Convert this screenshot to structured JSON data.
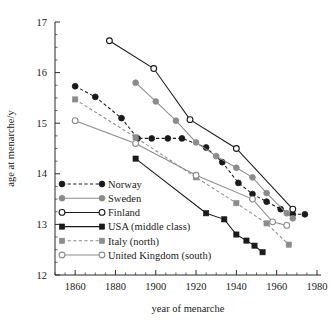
{
  "chart_data": {
    "type": "line",
    "title": "",
    "xlabel": "year of menarche",
    "ylabel": "age at menarche/y",
    "xlim": [
      1850,
      1982
    ],
    "ylim": [
      12,
      17
    ],
    "xticks": [
      1860,
      1880,
      1900,
      1920,
      1940,
      1960,
      1980
    ],
    "yticks": [
      12,
      13,
      14,
      15,
      16,
      17
    ],
    "xminor_step": 5,
    "yminor_step": 0.25,
    "grid": false,
    "legend_position": "lower left inside axes",
    "series": [
      {
        "name": "Norway",
        "color": "#1a1a1a",
        "marker": "filled-circle",
        "line": "dashed",
        "x": [
          1860,
          1870,
          1883,
          1891,
          1898,
          1906,
          1913,
          1925,
          1933,
          1941,
          1948,
          1955,
          1962,
          1968,
          1974
        ],
        "y": [
          15.73,
          15.52,
          15.1,
          14.7,
          14.7,
          14.7,
          14.7,
          14.52,
          14.23,
          13.82,
          13.6,
          13.45,
          13.3,
          13.2,
          13.2
        ]
      },
      {
        "name": "Sweden",
        "color": "#8c8c8c",
        "marker": "filled-circle",
        "line": "solid",
        "x": [
          1890,
          1900,
          1910,
          1920,
          1930,
          1940,
          1948,
          1955,
          1965,
          1968
        ],
        "y": [
          15.8,
          15.43,
          15.05,
          14.62,
          14.35,
          14.12,
          13.93,
          13.62,
          13.22,
          13.12
        ]
      },
      {
        "name": "Finland",
        "color": "#1a1a1a",
        "marker": "open-circle",
        "line": "solid",
        "x": [
          1877,
          1899,
          1917,
          1940,
          1968
        ],
        "y": [
          16.63,
          16.08,
          15.07,
          14.5,
          13.3
        ]
      },
      {
        "name": "USA (middle class)",
        "color": "#1a1a1a",
        "marker": "filled-square",
        "line": "solid",
        "x": [
          1890,
          1925,
          1934,
          1940,
          1945,
          1949,
          1953
        ],
        "y": [
          14.3,
          13.22,
          13.1,
          12.8,
          12.68,
          12.58,
          12.45
        ]
      },
      {
        "name": "Italy (north)",
        "color": "#8c8c8c",
        "marker": "filled-square",
        "line": "dashed",
        "x": [
          1860,
          1890,
          1920,
          1940,
          1955,
          1966
        ],
        "y": [
          15.47,
          14.72,
          13.93,
          13.42,
          13.02,
          12.6
        ]
      },
      {
        "name": "United Kingdom (south)",
        "color": "#8c8c8c",
        "marker": "open-circle",
        "line": "solid",
        "x": [
          1860,
          1890,
          1920,
          1948,
          1958,
          1965
        ],
        "y": [
          15.05,
          14.6,
          13.97,
          13.5,
          13.05,
          12.98
        ]
      }
    ]
  },
  "legend": {
    "items": [
      {
        "label": "Norway"
      },
      {
        "label": "Sweden"
      },
      {
        "label": "Finland"
      },
      {
        "label": "USA (middle class)"
      },
      {
        "label": "Italy (north)"
      },
      {
        "label": "United Kingdom (south)"
      }
    ]
  }
}
